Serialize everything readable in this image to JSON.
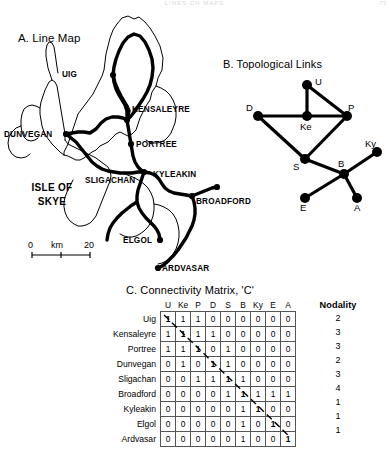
{
  "page": {
    "header_text": "LINES ON MAPS",
    "folio": "77"
  },
  "panel_a": {
    "title": "A. Line Map",
    "region_label_line1": "ISLE OF",
    "region_label_line2": "SKYE",
    "places": [
      {
        "name": "UIG",
        "label": "UIG"
      },
      {
        "name": "KENSALEYRE",
        "label": "KENSALEYRE"
      },
      {
        "name": "PORTREE",
        "label": "PORTREE"
      },
      {
        "name": "DUNVEGAN",
        "label": "DUNVEGAN"
      },
      {
        "name": "SLIGACHAN",
        "label": "SLIGACHAN"
      },
      {
        "name": "KYLEAKIN",
        "label": "KYLEAKIN"
      },
      {
        "name": "BROADFORD",
        "label": "BROADFORD"
      },
      {
        "name": "ELGOL",
        "label": "ELGOL"
      },
      {
        "name": "ARDVASAR",
        "label": "ARDVASAR"
      }
    ],
    "scale": {
      "start": "0",
      "unit": "km",
      "end": "20"
    }
  },
  "panel_b": {
    "title": "B. Topological Links",
    "nodes": [
      {
        "id": "U",
        "label": "U"
      },
      {
        "id": "Ke",
        "label": "Ke"
      },
      {
        "id": "P",
        "label": "P"
      },
      {
        "id": "D",
        "label": "D"
      },
      {
        "id": "S",
        "label": "S"
      },
      {
        "id": "B",
        "label": "B"
      },
      {
        "id": "Ky",
        "label": "Ky"
      },
      {
        "id": "E",
        "label": "E"
      },
      {
        "id": "A",
        "label": "A"
      }
    ],
    "edges": [
      [
        "U",
        "Ke"
      ],
      [
        "U",
        "P"
      ],
      [
        "Ke",
        "P"
      ],
      [
        "Ke",
        "D"
      ],
      [
        "D",
        "S"
      ],
      [
        "P",
        "S"
      ],
      [
        "S",
        "B"
      ],
      [
        "B",
        "Ky"
      ],
      [
        "B",
        "E"
      ],
      [
        "B",
        "A"
      ]
    ]
  },
  "panel_c": {
    "title": "C. Connectivity Matrix, 'C'",
    "nodality_header": "Nodality",
    "columns": [
      "U",
      "Ke",
      "P",
      "D",
      "S",
      "B",
      "Ky",
      "E",
      "A"
    ],
    "rows": [
      {
        "label": "Uig",
        "values": [
          1,
          1,
          1,
          0,
          0,
          0,
          0,
          0,
          0
        ],
        "nodality": 2
      },
      {
        "label": "Kensaleyre",
        "values": [
          1,
          1,
          1,
          1,
          0,
          0,
          0,
          0,
          0
        ],
        "nodality": 3
      },
      {
        "label": "Portree",
        "values": [
          1,
          1,
          1,
          0,
          1,
          0,
          0,
          0,
          0
        ],
        "nodality": 3
      },
      {
        "label": "Dunvegan",
        "values": [
          0,
          1,
          0,
          1,
          1,
          0,
          0,
          0,
          0
        ],
        "nodality": 2
      },
      {
        "label": "Sligachan",
        "values": [
          0,
          0,
          1,
          1,
          1,
          1,
          0,
          0,
          0
        ],
        "nodality": 3
      },
      {
        "label": "Broadford",
        "values": [
          0,
          0,
          0,
          0,
          1,
          1,
          1,
          1,
          1
        ],
        "nodality": 4
      },
      {
        "label": "Kyleakin",
        "values": [
          0,
          0,
          0,
          0,
          0,
          1,
          1,
          0,
          0
        ],
        "nodality": 1
      },
      {
        "label": "Elgol",
        "values": [
          0,
          0,
          0,
          0,
          0,
          1,
          0,
          1,
          0
        ],
        "nodality": 1
      },
      {
        "label": "Ardvasar",
        "values": [
          0,
          0,
          0,
          0,
          0,
          1,
          0,
          0,
          1
        ],
        "nodality": 1
      }
    ]
  },
  "colors": {
    "ink": "#000000",
    "grid": "#555555",
    "header_faint": "#d8d8dd"
  }
}
